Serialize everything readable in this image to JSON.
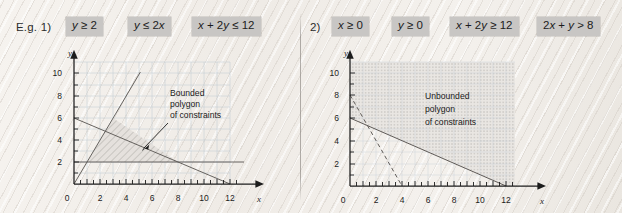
{
  "page": {
    "background_color": "#f2efeb",
    "divider_color": "#787570"
  },
  "panels": [
    {
      "id": "eg1",
      "label": "E.g. 1)",
      "constraints": [
        {
          "text": "y ≥ 2",
          "html_parts": [
            "y",
            " ≥ 2"
          ]
        },
        {
          "text": "y ≤ 2x",
          "html_parts": [
            "y",
            " ≤ 2",
            "x"
          ]
        },
        {
          "text": "x + 2y ≤ 12",
          "html_parts": [
            "x",
            " + 2",
            "y",
            " ≤ 12"
          ]
        }
      ],
      "annotation": {
        "line1": "Bounded",
        "line2": "polygon",
        "line3": "of constraints"
      },
      "chart": {
        "type": "line",
        "xlabel": "x",
        "ylabel": "y",
        "origin_label": "0",
        "xlim": [
          0,
          13.5
        ],
        "ylim": [
          0,
          11
        ],
        "xticks": [
          2,
          4,
          6,
          8,
          10,
          12
        ],
        "yticks": [
          2,
          4,
          6,
          8,
          10
        ],
        "grid": true,
        "series": [
          {
            "name": "y = 2",
            "points": [
              [
                0,
                2
              ],
              [
                13,
                2
              ]
            ],
            "style": "solid"
          },
          {
            "name": "y = 2x",
            "points": [
              [
                0,
                0
              ],
              [
                5.1,
                10.2
              ]
            ],
            "style": "solid"
          },
          {
            "name": "x + 2y = 12",
            "points": [
              [
                0,
                6
              ],
              [
                12,
                0
              ]
            ],
            "style": "solid"
          }
        ],
        "region": {
          "name": "Bounded polygon of constraints",
          "vertices": [
            [
              1,
              2
            ],
            [
              8,
              2
            ],
            [
              3,
              6
            ]
          ],
          "fill": "hatch",
          "bounded": true
        }
      }
    },
    {
      "id": "eg2",
      "label": "2)",
      "constraints": [
        {
          "text": "x ≥ 0",
          "html_parts": [
            "x",
            " ≥ 0"
          ]
        },
        {
          "text": "y ≥ 0",
          "html_parts": [
            "y",
            " ≥ 0"
          ]
        },
        {
          "text": "x + 2y ≥ 12",
          "html_parts": [
            "x",
            " + 2",
            "y",
            " ≥ 12"
          ]
        },
        {
          "text": "2x + y > 8",
          "html_parts": [
            "2",
            "x",
            " + ",
            "y",
            " > 8"
          ]
        }
      ],
      "annotation": {
        "line1": "Unbounded",
        "line2": "polygon",
        "line3": "of constraints"
      },
      "chart": {
        "type": "line",
        "xlabel": "x",
        "ylabel": "y",
        "origin_label": "0",
        "xlim": [
          0,
          13.8
        ],
        "ylim": [
          0,
          11
        ],
        "xticks": [
          2,
          4,
          6,
          8,
          10,
          12
        ],
        "yticks": [
          2,
          4,
          6,
          8,
          10
        ],
        "grid": true,
        "series": [
          {
            "name": "x + 2y = 12",
            "points": [
              [
                0,
                6
              ],
              [
                12,
                0
              ]
            ],
            "style": "solid"
          },
          {
            "name": "2x + y = 8",
            "points": [
              [
                0,
                8
              ],
              [
                4,
                0
              ]
            ],
            "style": "dashed"
          }
        ],
        "region": {
          "name": "Unbounded polygon of constraints",
          "vertices": [
            [
              0,
              6
            ],
            [
              12,
              0
            ],
            [
              13,
              0
            ],
            [
              13,
              10
            ],
            [
              0,
              10
            ]
          ],
          "fill": "hatch",
          "bounded": false
        }
      }
    }
  ]
}
